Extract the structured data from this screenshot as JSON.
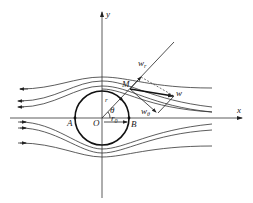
{
  "figure": {
    "axes": {
      "x_label": "x",
      "y_label": "y"
    },
    "points": {
      "origin": "O",
      "left": "A",
      "right": "B",
      "field_point": "M"
    },
    "radius_label": "r",
    "radius_sub": "0",
    "radial_label": "r",
    "angle_label": "θ",
    "velocity": {
      "resultant": "w",
      "radial_main": "w",
      "radial_sub": "r",
      "tangential_main": "w",
      "tangential_sub": "θ"
    },
    "colors": {
      "line": "#333333",
      "background": "#ffffff"
    }
  }
}
